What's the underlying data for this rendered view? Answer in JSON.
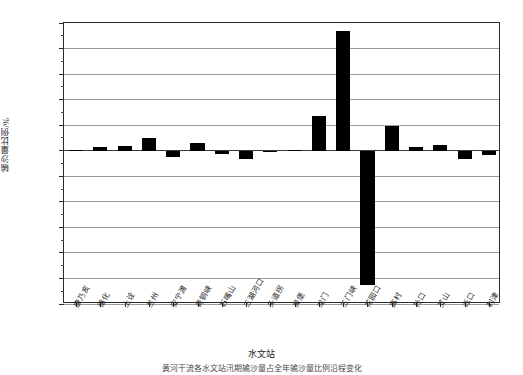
{
  "chart_data": {
    "type": "bar",
    "title": "",
    "xlabel": "水文站",
    "ylabel": "输沙量比例/%",
    "ylim": [
      -120,
      100
    ],
    "ytick_step": 20,
    "yticks": [
      100,
      80,
      60,
      40,
      20,
      0,
      -20,
      -40,
      -60,
      -80,
      -100,
      -120
    ],
    "ytick_labels": [
      "100",
      "80",
      "60",
      "40",
      "20",
      "0",
      "-20",
      "-40",
      "-60",
      "-80",
      "-100",
      "-120"
    ],
    "grid": true,
    "grid_axis": "y",
    "legend": "none",
    "bar_color": "#000000",
    "categories": [
      "唐乃亥",
      "循化",
      "上诠",
      "兰州",
      "安宁渡",
      "青铜峡",
      "石嘴山",
      "三湖河口",
      "头道拐",
      "吴堡",
      "龙门",
      "三门峡",
      "花园口",
      "高村",
      "孙口",
      "艾山",
      "泺口",
      "利津"
    ],
    "values": [
      0.6,
      2.8,
      3.4,
      9.6,
      -4.8,
      6.2,
      -2.6,
      -6.4,
      -1.0,
      0.8,
      27.0,
      94.0,
      -105.0,
      19.0,
      3.0,
      4.6,
      -6.2,
      -3.0
    ],
    "series_name": "输沙量比例"
  },
  "caption": {
    "text": "黄河干流各水文站汛期输沙量占全年输沙量比例沿程变化"
  }
}
